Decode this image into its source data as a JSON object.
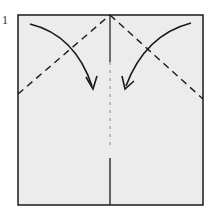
{
  "diagram": {
    "step_number": "1",
    "paper": {
      "x": 18,
      "y": 15,
      "width": 185,
      "height": 190,
      "fill": "#ececec",
      "stroke": "#1a1a1a"
    },
    "fold_lines": [
      {
        "name": "left-valley-fold",
        "style": "dashed",
        "from": [
          18,
          94
        ],
        "to": [
          110,
          15
        ]
      },
      {
        "name": "right-valley-fold",
        "style": "dashed",
        "from": [
          110,
          15
        ],
        "to": [
          203,
          99
        ]
      },
      {
        "name": "center-crease",
        "style": "dash-dot",
        "from": [
          110,
          15
        ],
        "to": [
          110,
          205
        ]
      }
    ],
    "arrows": [
      {
        "name": "fold-arrow-left",
        "direction": "down-right"
      },
      {
        "name": "fold-arrow-right",
        "direction": "down-left"
      }
    ],
    "colors": {
      "ink": "#1a1a1a",
      "paper": "#ececec",
      "background": "#ffffff"
    }
  }
}
